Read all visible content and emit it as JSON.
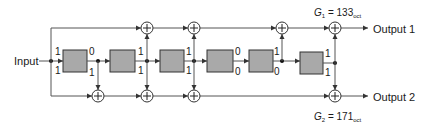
{
  "diagram": {
    "type": "convolutional-encoder",
    "input_label": "Input",
    "outputs": [
      {
        "label": "Output 1",
        "generator": "G",
        "subscript_index": "1",
        "value": "133",
        "base": "oct"
      },
      {
        "label": "Output 2",
        "generator": "G",
        "subscript_index": "2",
        "value": "171",
        "base": "oct"
      }
    ],
    "g1_text": {
      "prefix": "G",
      "index": "1",
      "eq": " = 133",
      "base": "oct"
    },
    "g2_text": {
      "prefix": "G",
      "index": "2",
      "eq": " = 171",
      "base": "oct"
    },
    "shift_registers": 6,
    "tap_bits": {
      "input": {
        "top": "1",
        "bottom": "1"
      },
      "after_reg1": {
        "top": "0",
        "bottom": "1"
      },
      "after_reg2": {
        "top": "1",
        "bottom": "1"
      },
      "after_reg3": {
        "top": "1",
        "bottom": "1"
      },
      "after_reg4": {
        "top": "0",
        "bottom": "0"
      },
      "after_reg5": {
        "top": "1",
        "bottom": "0"
      },
      "after_reg6": {
        "top": "1",
        "bottom": "1"
      }
    },
    "colors": {
      "register_fill": "#a9a9a9",
      "wire": "#555555",
      "text": "#1a1a1a"
    }
  }
}
